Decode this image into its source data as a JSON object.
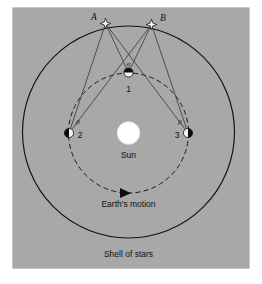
{
  "figure": {
    "title_caption": "Shell of stars",
    "background_color": "#a8a8a8",
    "panel": {
      "x": 13,
      "y": 8,
      "width": 236,
      "height": 260
    },
    "sun": {
      "label": "Sun",
      "color": "#ffffff",
      "cx": 128.5,
      "cy": 133,
      "r": 11.5,
      "label_x": 128.5,
      "label_y": 158
    },
    "shell_of_stars": {
      "label": "Shell of stars",
      "cx": 128.5,
      "cy": 132,
      "r": 106,
      "stroke": "#111111",
      "label_x": 128.5,
      "label_y": 255
    },
    "earth_orbit": {
      "label": "Earth's motion",
      "cx": 128.5,
      "cy": 133,
      "r": 60,
      "stroke": "#111111",
      "dashed": true,
      "label_x": 128.5,
      "label_y": 205
    },
    "arrow": {
      "name": "orbit-direction-arrow",
      "x": 124,
      "y": 193,
      "direction": "right"
    },
    "stars": [
      {
        "id": "A",
        "label": "A",
        "cx": 105.5,
        "cy": 23.5,
        "label_x": 94,
        "label_y": 19
      },
      {
        "id": "B",
        "label": "B",
        "cx": 151.5,
        "cy": 24.5,
        "label_x": 161,
        "label_y": 20
      }
    ],
    "earth_positions": [
      {
        "id": "1",
        "label": "1",
        "cx": 128.5,
        "cy": 72.5,
        "label_x": 128.5,
        "label_y": 91
      },
      {
        "id": "2",
        "label": "2",
        "cx": 69.0,
        "cy": 133.0,
        "label_x": 80,
        "label_y": 139
      },
      {
        "id": "3",
        "label": "3",
        "cx": 188.0,
        "cy": 133.0,
        "label_x": 177,
        "label_y": 139
      }
    ],
    "angles": [
      {
        "id": "alpha",
        "label": "α",
        "x": 128.5,
        "y": 64,
        "at_earth": "1"
      },
      {
        "id": "beta",
        "label": "β",
        "x": 77,
        "y": 122,
        "at_earth": "2"
      },
      {
        "id": "beta2",
        "label": "β",
        "x": 181,
        "y": 122,
        "at_earth": "3"
      }
    ],
    "sight_lines": [
      {
        "from": "1",
        "to": "A"
      },
      {
        "from": "1",
        "to": "B"
      },
      {
        "from": "2",
        "to": "A"
      },
      {
        "from": "2",
        "to": "B"
      },
      {
        "from": "3",
        "to": "A"
      },
      {
        "from": "3",
        "to": "B"
      }
    ]
  }
}
